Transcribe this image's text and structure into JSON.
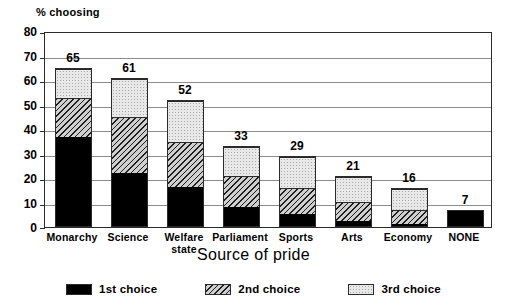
{
  "chart_data": {
    "type": "bar",
    "subtype": "stacked-bar",
    "title": "",
    "cut_off_header_text": "",
    "xlabel": "Source of pride",
    "ylabel": "% choosing",
    "ylim": [
      0,
      80
    ],
    "ytick_step": 10,
    "yticks": [
      "80",
      "70",
      "60",
      "50",
      "40",
      "30",
      "20",
      "10",
      "0"
    ],
    "grid": true,
    "grid_axis": "y",
    "legend_position": "bottom",
    "categories": [
      "Monarchy",
      "Science",
      "Welfare state",
      "Parliament",
      "Sports",
      "Arts",
      "Economy",
      "NONE"
    ],
    "category_label_lines": [
      [
        "Monarchy"
      ],
      [
        "Science"
      ],
      [
        "Welfare",
        "state"
      ],
      [
        "Parliament"
      ],
      [
        "Sports"
      ],
      [
        "Arts"
      ],
      [
        "Economy"
      ],
      [
        "NONE"
      ]
    ],
    "series": [
      {
        "name": "1st choice",
        "pattern": "solid-black",
        "color": "#000000",
        "values": [
          37,
          22,
          16,
          8,
          5,
          2,
          1,
          7
        ]
      },
      {
        "name": "2nd choice",
        "pattern": "diagonal-hatch",
        "color": "#cfcfcf",
        "values": [
          16,
          23,
          19,
          13,
          11,
          8,
          6,
          0
        ]
      },
      {
        "name": "3rd choice",
        "pattern": "light-dotted",
        "color": "#e8e8e8",
        "values": [
          12,
          16,
          17,
          12,
          13,
          11,
          9,
          0
        ]
      }
    ],
    "totals": [
      65,
      61,
      52,
      33,
      29,
      21,
      16,
      7
    ],
    "total_labels": [
      "65",
      "61",
      "52",
      "33",
      "29",
      "21",
      "16",
      "7"
    ]
  },
  "legend": {
    "items": [
      {
        "label": "1st choice",
        "swatch": "solid-black-swatch"
      },
      {
        "label": "2nd choice",
        "swatch": "diagonal-hatch-swatch"
      },
      {
        "label": "3rd choice",
        "swatch": "light-dotted-swatch"
      }
    ]
  }
}
